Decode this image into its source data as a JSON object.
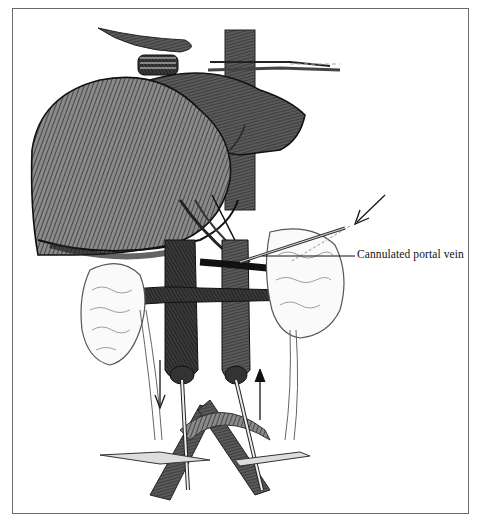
{
  "figure": {
    "labels": [
      {
        "text": "Cannulated portal vein",
        "target": "portal-vein"
      }
    ],
    "colors": {
      "ink": "#1a1a1a",
      "shade": "#3c3c3c",
      "light": "#9a9a9a",
      "frame": "#6a6a6a",
      "background": "#ffffff"
    }
  }
}
